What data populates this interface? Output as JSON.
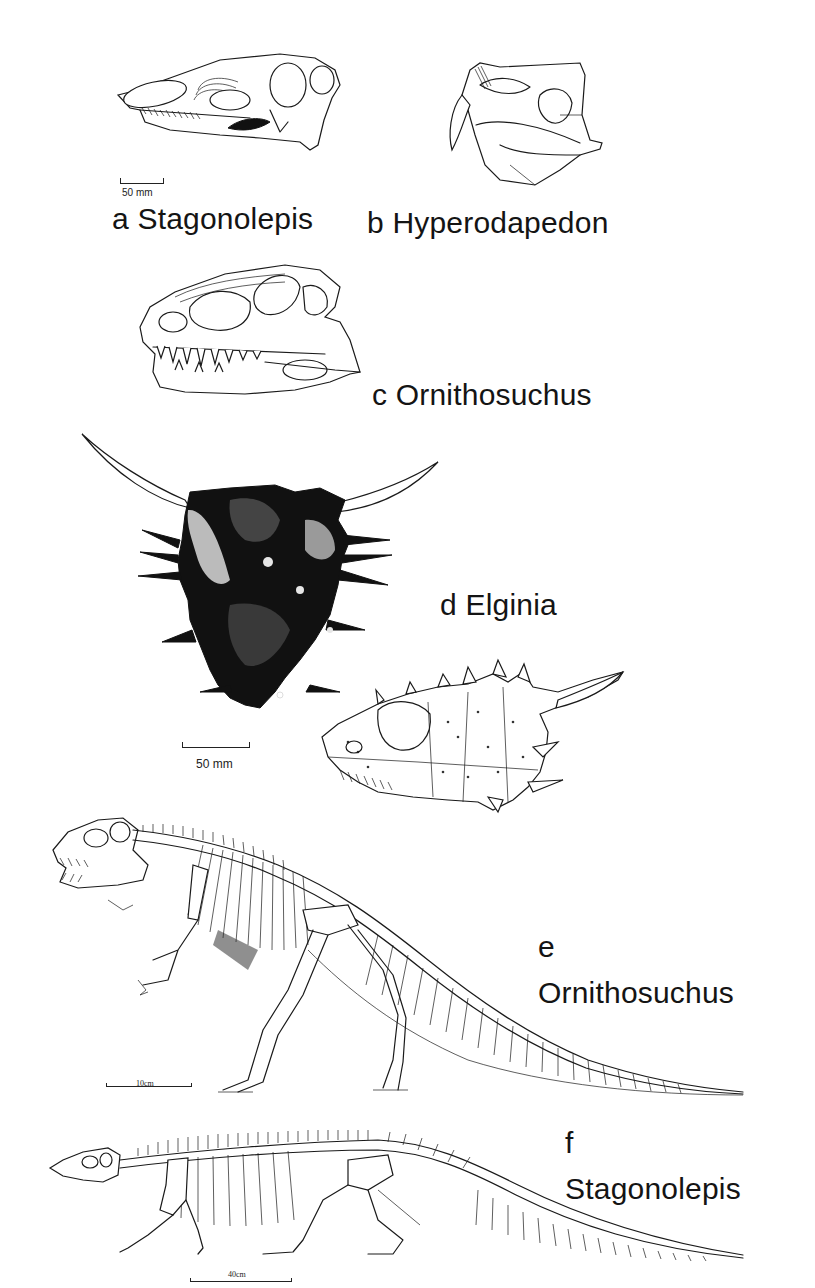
{
  "figure": {
    "panels": [
      {
        "id": "a",
        "letter": "a",
        "name": "Stagonolepis",
        "label": "a Stagonolepis",
        "subject": "skull-lateral-view"
      },
      {
        "id": "b",
        "letter": "b",
        "name": "Hyperodapedon",
        "label": "b Hyperodapedon",
        "subject": "skull-lateral-view"
      },
      {
        "id": "c",
        "letter": "c",
        "name": "Ornithosuchus",
        "label": "c Ornithosuchus",
        "subject": "skull-lateral-view"
      },
      {
        "id": "d",
        "letter": "d",
        "name": "Elginia",
        "label": "d Elginia",
        "subject": "skull-dorsal-and-lateral-view"
      },
      {
        "id": "e",
        "letter": "e",
        "name": "Ornithosuchus",
        "label": "e",
        "subject": "skeleton-reconstruction"
      },
      {
        "id": "f",
        "letter": "f",
        "name": "Stagonolepis",
        "label": "f",
        "subject": "skeleton-reconstruction"
      }
    ],
    "scale_bars": {
      "ab": "50 mm",
      "d": "50 mm",
      "e": "10cm",
      "f": "40cm"
    }
  }
}
